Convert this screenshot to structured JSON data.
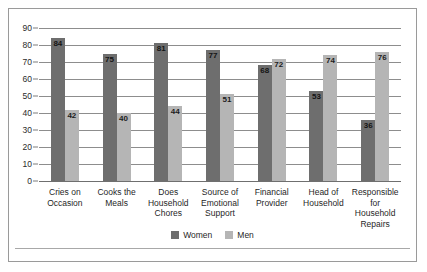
{
  "chart_data": {
    "type": "bar",
    "title": "",
    "subtitle": "",
    "xlabel": "",
    "ylabel": "",
    "ylim": [
      0,
      90
    ],
    "ytick_step": 10,
    "yticks": [
      90,
      80,
      70,
      60,
      50,
      40,
      30,
      20,
      10,
      0
    ],
    "grid": true,
    "legend_position": "bottom-center",
    "categories": [
      "Cries on Occasion",
      "Cooks the Meals",
      "Does Household Chores",
      "Source of Emotional Support",
      "Financial Provider",
      "Head of Household",
      "Responsible for Household Repairs"
    ],
    "category_lines": [
      [
        "Cries on",
        "Occasion"
      ],
      [
        "Cooks the",
        "Meals"
      ],
      [
        "Does",
        "Household",
        "Chores"
      ],
      [
        "Source of",
        "Emotional",
        "Support"
      ],
      [
        "Financial",
        "Provider"
      ],
      [
        "Head of",
        "Household"
      ],
      [
        "Responsible",
        "for",
        "Household",
        "Repairs"
      ]
    ],
    "series": [
      {
        "name": "Women",
        "color": "#6e6e6e",
        "values": [
          84,
          75,
          81,
          77,
          68,
          53,
          36
        ]
      },
      {
        "name": "Men",
        "color": "#b5b5b5",
        "values": [
          42,
          40,
          44,
          51,
          72,
          74,
          76
        ]
      }
    ]
  },
  "legend": {
    "entries": [
      {
        "label": "Women"
      },
      {
        "label": "Men"
      }
    ]
  },
  "colors": {
    "women_bar": "#6e6e6e",
    "men_bar": "#b5b5b5",
    "gridline": "#8d8d8d",
    "border": "#9a9a9a",
    "background": "#ffffff",
    "text": "#1f1f1f"
  }
}
